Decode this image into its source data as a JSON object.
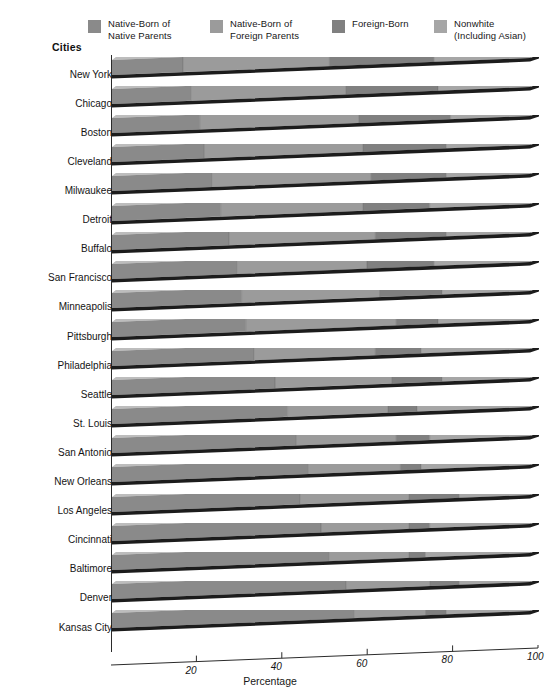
{
  "chart_data": {
    "type": "bar",
    "orientation": "horizontal",
    "stacked": "100%",
    "title": "",
    "xlabel": "Percentage",
    "ylabel": "Cities",
    "xlim": [
      0,
      100
    ],
    "xticks": [
      20,
      40,
      60,
      80,
      100
    ],
    "grid": false,
    "legend_position": "top",
    "categories": [
      "New York",
      "Chicago",
      "Boston",
      "Cleveland",
      "Milwaukee",
      "Detroit",
      "Buffalo",
      "San Francisco",
      "Minneapolis",
      "Pittsburgh",
      "Philadelphia",
      "Seattle",
      "St. Louis",
      "San Antonio",
      "New Orleans",
      "Los Angeles",
      "Cincinnati",
      "Baltimore",
      "Denver",
      "Kansas City"
    ],
    "series": [
      {
        "name": "Native-Born of Native Parents",
        "color": "#8a8a8a",
        "values": [
          17,
          19,
          21,
          22,
          24,
          26,
          28,
          30,
          31,
          32,
          34,
          39,
          42,
          44,
          47,
          45,
          50,
          52,
          56,
          58
        ]
      },
      {
        "name": "Native-Born of Foreign Parents",
        "color": "#9b9b9b",
        "values": [
          35,
          37,
          38,
          38,
          38,
          34,
          35,
          31,
          33,
          36,
          29,
          28,
          24,
          24,
          22,
          26,
          21,
          19,
          20,
          17
        ]
      },
      {
        "name": "Foreign-Born",
        "color": "#808080",
        "values": [
          25,
          22,
          22,
          20,
          18,
          16,
          17,
          16,
          15,
          10,
          11,
          12,
          7,
          8,
          5,
          12,
          5,
          4,
          7,
          5
        ]
      },
      {
        "name": "Nonwhite (Including Asian)",
        "color": "#a6a6a6",
        "values": [
          23,
          22,
          19,
          20,
          20,
          24,
          20,
          23,
          21,
          22,
          26,
          21,
          27,
          24,
          26,
          17,
          24,
          25,
          17,
          20
        ]
      }
    ]
  },
  "legend": {
    "items": [
      {
        "label": "Native-Born of\nNative Parents",
        "color": "#8a8a8a",
        "x": 88
      },
      {
        "label": "Native-Born of\nForeign Parents",
        "color": "#9b9b9b",
        "x": 210
      },
      {
        "label": "Foreign-Born",
        "color": "#808080",
        "x": 332
      },
      {
        "label": "Nonwhite\n(Including Asian)",
        "color": "#a6a6a6",
        "x": 434
      }
    ]
  },
  "axes": {
    "y_title": "Cities",
    "x_title": "Percentage",
    "x_tick_labels": [
      "20",
      "40",
      "60",
      "80",
      "100"
    ]
  },
  "caption": {
    "text": ""
  },
  "colors": {
    "background": "#ffffff",
    "axis": "#2b2b2b",
    "text": "#141414",
    "bar_shadow": "#1c1c1c",
    "bar_top": "#bdbdbd",
    "bar_side": "#6e6e6e"
  }
}
